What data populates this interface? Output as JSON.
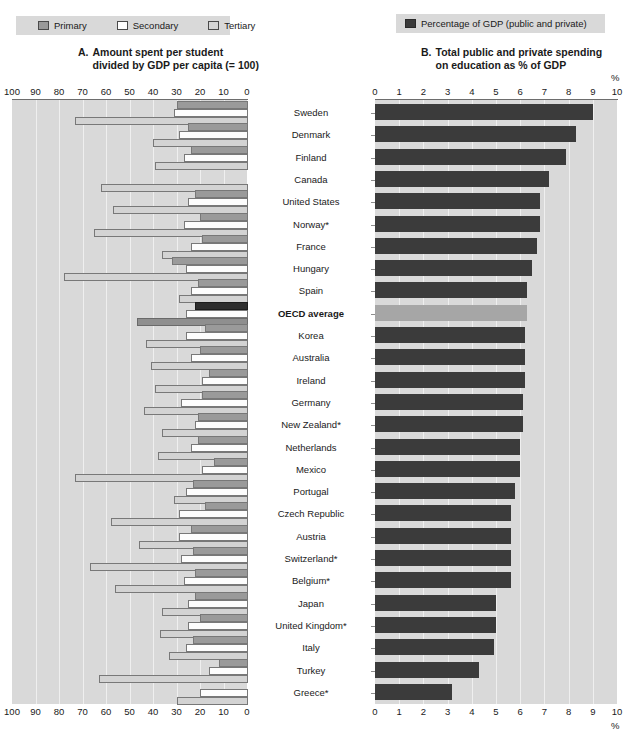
{
  "legend_a": {
    "items": [
      {
        "label": "Primary",
        "icon": "square-swatch-primary",
        "color": "#9a9a9a"
      },
      {
        "label": "Secondary",
        "icon": "square-swatch-secondary",
        "color": "#ffffff"
      },
      {
        "label": "Tertiary",
        "icon": "square-swatch-tertiary",
        "color": "#d6d6d6"
      }
    ]
  },
  "legend_b": {
    "items": [
      {
        "label": "Percentage of GDP (public and private)",
        "icon": "square-swatch-gdp",
        "color": "#3b3b3b"
      }
    ]
  },
  "panel_a": {
    "letter": "A.",
    "title_line1": "Amount spent per student",
    "title_line2": "divided by GDP per capita (= 100)",
    "axis_ticks": [
      "100",
      "90",
      "80",
      "70",
      "60",
      "50",
      "40",
      "30",
      "20",
      "10",
      "0"
    ]
  },
  "panel_b": {
    "letter": "B.",
    "title_line1": "Total public and private spending",
    "title_line2": "on education as % of GDP",
    "axis_ticks": [
      "0",
      "1",
      "2",
      "3",
      "4",
      "5",
      "6",
      "7",
      "8",
      "9",
      "10"
    ],
    "unit_label": "%"
  },
  "chart_data": [
    {
      "type": "bar",
      "id": "panel-a",
      "orientation": "horizontal-reversed",
      "title": "A. Amount spent per student divided by GDP per capita (= 100)",
      "xlabel": "",
      "ylabel": "",
      "xlim": [
        100,
        0
      ],
      "grid": true,
      "legend_position": "top-left",
      "categories": [
        "Sweden",
        "Denmark",
        "Finland",
        "Canada",
        "United States",
        "Norway*",
        "France",
        "Hungary",
        "Spain",
        "OECD average",
        "Korea",
        "Australia",
        "Ireland",
        "Germany",
        "New Zealand*",
        "Netherlands",
        "Mexico",
        "Portugal",
        "Czech Republic",
        "Austria",
        "Switzerland*",
        "Belgium*",
        "Japan",
        "United Kingdom*",
        "Italy",
        "Turkey",
        "Greece*"
      ],
      "series": [
        {
          "name": "Primary",
          "values": [
            30,
            25,
            24,
            null,
            22,
            20,
            19,
            32,
            21,
            22,
            18,
            20,
            16,
            19,
            21,
            21,
            14,
            23,
            18,
            24,
            23,
            22,
            22,
            20,
            23,
            12,
            null
          ]
        },
        {
          "name": "Secondary",
          "values": [
            31,
            29,
            27,
            null,
            25,
            27,
            24,
            26,
            24,
            26,
            26,
            24,
            19,
            28,
            22,
            24,
            19,
            26,
            29,
            29,
            28,
            27,
            25,
            25,
            26,
            16,
            20
          ]
        },
        {
          "name": "Tertiary",
          "values": [
            73,
            40,
            39,
            62,
            57,
            65,
            36,
            78,
            29,
            47,
            43,
            41,
            39,
            44,
            36,
            38,
            73,
            31,
            58,
            46,
            67,
            56,
            36,
            37,
            33,
            63,
            30
          ]
        }
      ]
    },
    {
      "type": "bar",
      "id": "panel-b",
      "orientation": "horizontal",
      "title": "B. Total public and private spending on education as % of GDP",
      "xlabel": "%",
      "ylabel": "",
      "xlim": [
        0,
        10
      ],
      "grid": true,
      "legend_position": "top-right",
      "categories": [
        "Sweden",
        "Denmark",
        "Finland",
        "Canada",
        "United States",
        "Norway*",
        "France",
        "Hungary",
        "Spain",
        "OECD average",
        "Korea",
        "Australia",
        "Ireland",
        "Germany",
        "New Zealand*",
        "Netherlands",
        "Mexico",
        "Portugal",
        "Czech Republic",
        "Austria",
        "Switzerland*",
        "Belgium*",
        "Japan",
        "United Kingdom*",
        "Italy",
        "Turkey",
        "Greece*"
      ],
      "series": [
        {
          "name": "Percentage of GDP (public and private)",
          "values": [
            9.0,
            8.3,
            7.9,
            7.2,
            6.8,
            6.8,
            6.7,
            6.5,
            6.3,
            6.3,
            6.2,
            6.2,
            6.2,
            6.1,
            6.1,
            6.0,
            6.0,
            5.8,
            5.6,
            5.6,
            5.6,
            5.6,
            5.0,
            5.0,
            4.9,
            4.3,
            3.2
          ]
        }
      ],
      "highlight_category": "OECD average"
    }
  ],
  "countries": [
    {
      "name": "Sweden",
      "bold": false
    },
    {
      "name": "Denmark",
      "bold": false
    },
    {
      "name": "Finland",
      "bold": false
    },
    {
      "name": "Canada",
      "bold": false
    },
    {
      "name": "United States",
      "bold": false
    },
    {
      "name": "Norway*",
      "bold": false
    },
    {
      "name": "France",
      "bold": false
    },
    {
      "name": "Hungary",
      "bold": false
    },
    {
      "name": "Spain",
      "bold": false
    },
    {
      "name": "OECD average",
      "bold": true
    },
    {
      "name": "Korea",
      "bold": false
    },
    {
      "name": "Australia",
      "bold": false
    },
    {
      "name": "Ireland",
      "bold": false
    },
    {
      "name": "Germany",
      "bold": false
    },
    {
      "name": "New Zealand*",
      "bold": false
    },
    {
      "name": "Netherlands",
      "bold": false
    },
    {
      "name": "Mexico",
      "bold": false
    },
    {
      "name": "Portugal",
      "bold": false
    },
    {
      "name": "Czech Republic",
      "bold": false
    },
    {
      "name": "Austria",
      "bold": false
    },
    {
      "name": "Switzerland*",
      "bold": false
    },
    {
      "name": "Belgium*",
      "bold": false
    },
    {
      "name": "Japan",
      "bold": false
    },
    {
      "name": "United Kingdom*",
      "bold": false
    },
    {
      "name": "Italy",
      "bold": false
    },
    {
      "name": "Turkey",
      "bold": false
    },
    {
      "name": "Greece*",
      "bold": false
    }
  ]
}
